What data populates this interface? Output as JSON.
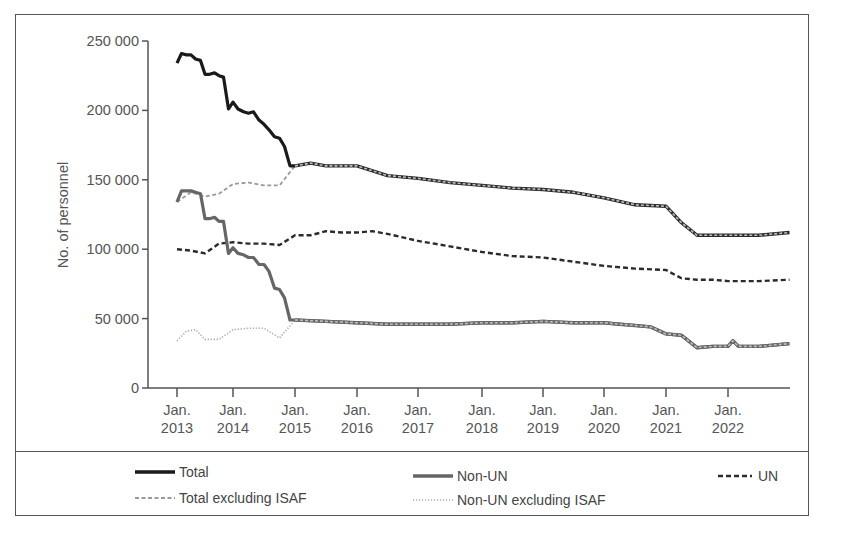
{
  "chart_data": {
    "type": "line",
    "title": "",
    "xlabel": "",
    "ylabel": "No. of personnel",
    "ylim": [
      0,
      250000
    ],
    "yticks": [
      0,
      50000,
      100000,
      150000,
      200000,
      250000
    ],
    "ytick_labels": [
      "0",
      "50 000",
      "100 000",
      "150 000",
      "200 000",
      "250 000"
    ],
    "xtick_labels": [
      [
        "Jan.",
        "2013"
      ],
      [
        "Jan.",
        "2014"
      ],
      [
        "Jan.",
        "2015"
      ],
      [
        "Jan.",
        "2016"
      ],
      [
        "Jan.",
        "2017"
      ],
      [
        "Jan.",
        "2018"
      ],
      [
        "Jan.",
        "2019"
      ],
      [
        "Jan.",
        "2020"
      ],
      [
        "Jan.",
        "2021"
      ],
      [
        "Jan.",
        "2022"
      ]
    ],
    "xlim": [
      2013.0,
      2023.0
    ],
    "grid": false,
    "legend_position": "bottom",
    "series": [
      {
        "name": "Total",
        "style": "solid-black-thick",
        "x": [
          2013.0,
          2013.08,
          2013.17,
          2013.25,
          2013.33,
          2013.42,
          2013.5,
          2013.58,
          2013.67,
          2013.75,
          2013.83,
          2013.92,
          2014.0,
          2014.08,
          2014.17,
          2014.25,
          2014.33,
          2014.42,
          2014.5,
          2014.58,
          2014.67,
          2014.75,
          2014.83,
          2014.92,
          2015.0
        ],
        "values": [
          234000,
          241000,
          240000,
          240000,
          237000,
          236000,
          226000,
          226000,
          227000,
          225000,
          224000,
          201000,
          206000,
          201000,
          199000,
          198000,
          199000,
          193000,
          190000,
          186000,
          181000,
          180000,
          174000,
          160000,
          160000
        ]
      },
      {
        "name": "Total excluding ISAF",
        "style": "dashed-lightgray",
        "x": [
          2013.0,
          2013.25,
          2013.5,
          2013.75,
          2014.0,
          2014.25,
          2014.5,
          2014.75,
          2015.0,
          2015.25,
          2015.5,
          2015.75,
          2016.0,
          2016.5,
          2017.0,
          2017.5,
          2018.0,
          2018.5,
          2019.0,
          2019.5,
          2020.0,
          2020.5,
          2021.0,
          2021.25,
          2021.5,
          2021.75,
          2022.0,
          2022.5,
          2023.0
        ],
        "values": [
          134000,
          141000,
          138000,
          140000,
          147000,
          148000,
          146000,
          146000,
          160000,
          162000,
          160000,
          160000,
          160000,
          153000,
          151000,
          148000,
          146000,
          144000,
          143000,
          141000,
          137000,
          132000,
          131000,
          119000,
          110000,
          110000,
          110000,
          110000,
          112000
        ]
      },
      {
        "name": "Non-UN",
        "style": "solid-gray-thick",
        "x": [
          2013.0,
          2013.08,
          2013.17,
          2013.25,
          2013.33,
          2013.42,
          2013.5,
          2013.58,
          2013.67,
          2013.75,
          2013.83,
          2013.92,
          2014.0,
          2014.08,
          2014.17,
          2014.25,
          2014.33,
          2014.42,
          2014.5,
          2014.58,
          2014.67,
          2014.75,
          2014.83,
          2014.92,
          2015.0,
          2015.5,
          2016.0,
          2016.5,
          2017.0,
          2017.5,
          2018.0,
          2018.5,
          2019.0,
          2019.5,
          2020.0,
          2020.25,
          2020.5,
          2020.75,
          2021.0,
          2021.25,
          2021.5,
          2021.75,
          2022.0,
          2022.08,
          2022.17,
          2022.5,
          2023.0
        ],
        "values": [
          134000,
          142000,
          142000,
          142000,
          141000,
          140000,
          122000,
          122000,
          123000,
          120000,
          120000,
          97000,
          101000,
          97000,
          96000,
          94000,
          94000,
          89000,
          89000,
          84000,
          72000,
          71000,
          65000,
          49000,
          49000,
          48000,
          47000,
          46000,
          46000,
          46000,
          47000,
          47000,
          48000,
          47000,
          47000,
          46000,
          45000,
          44000,
          39000,
          38000,
          29000,
          30000,
          30000,
          34000,
          30000,
          30000,
          32000
        ]
      },
      {
        "name": "Non-UN excluding ISAF",
        "style": "dotted-lightgray",
        "x": [
          2013.0,
          2013.17,
          2013.33,
          2013.5,
          2013.75,
          2014.0,
          2014.25,
          2014.5,
          2014.75,
          2015.0
        ],
        "values": [
          34000,
          41000,
          42000,
          35000,
          35000,
          42000,
          43000,
          43000,
          36000,
          49000
        ]
      },
      {
        "name": "UN",
        "style": "dashed-black",
        "x": [
          2013.0,
          2013.25,
          2013.5,
          2013.75,
          2014.0,
          2014.25,
          2014.5,
          2014.75,
          2015.0,
          2015.25,
          2015.5,
          2015.75,
          2016.0,
          2016.25,
          2016.5,
          2017.0,
          2017.5,
          2018.0,
          2018.5,
          2019.0,
          2019.5,
          2020.0,
          2020.5,
          2021.0,
          2021.25,
          2021.5,
          2021.75,
          2022.0,
          2022.5,
          2023.0
        ],
        "values": [
          100000,
          99000,
          97000,
          104000,
          105000,
          104000,
          104000,
          103000,
          110000,
          110000,
          113000,
          112000,
          112000,
          113000,
          111000,
          106000,
          102000,
          98000,
          95000,
          94000,
          91000,
          88000,
          86000,
          85000,
          79000,
          78000,
          78000,
          77000,
          77000,
          78000
        ]
      }
    ]
  },
  "legend": {
    "items": [
      {
        "label": "Total",
        "style": "solid-black-thick"
      },
      {
        "label": "Non-UN",
        "style": "solid-gray-thick"
      },
      {
        "label": "UN",
        "style": "dashed-black"
      },
      {
        "label": "Total excluding ISAF",
        "style": "dashed-lightgray"
      },
      {
        "label": "Non-UN excluding ISAF",
        "style": "dotted-lightgray"
      }
    ]
  },
  "colors": {
    "total": "#1a1a1a",
    "non_un": "#666666",
    "un": "#2b2b2b",
    "total_ex_isaf": "#9a9a9a",
    "non_un_ex_isaf": "#aaaaaa",
    "axis": "#555555",
    "frame": "#555555"
  }
}
